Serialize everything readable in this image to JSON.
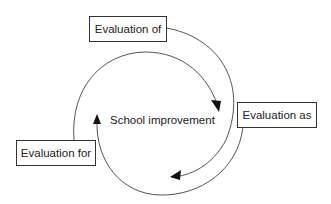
{
  "diagram": {
    "type": "cycle",
    "center": {
      "label": "School improvement"
    },
    "nodes": [
      {
        "id": "of",
        "label": "Evaluation of"
      },
      {
        "id": "as",
        "label": "Evaluation as"
      },
      {
        "id": "for",
        "label": "Evaluation for"
      }
    ],
    "edges": [
      {
        "from": "of",
        "to": "as",
        "direction": "clockwise"
      },
      {
        "from": "as",
        "to": "for",
        "direction": "clockwise"
      },
      {
        "from": "for",
        "to": "of",
        "direction": "clockwise"
      }
    ],
    "colors": {
      "line": "#444444",
      "box_border": "#333333",
      "text": "#222222",
      "background": "#ffffff"
    }
  }
}
